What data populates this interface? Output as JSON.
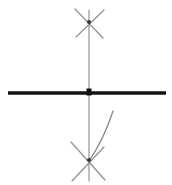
{
  "figure": {
    "width": 172,
    "height": 185,
    "background_color": "#ffffff",
    "ink_color_dark": "#1a1a1a",
    "ink_color_light": "#9a9a9a",
    "ink_color_mid": "#6e6e6e"
  },
  "elements": {
    "horizontal_bar": {
      "name": "horizontal axis bar",
      "x1": 8,
      "y1": 93,
      "x2": 166,
      "y2": 93,
      "thickness": 3.6,
      "color": "#141414"
    },
    "vertical_line": {
      "name": "vertical axis line",
      "x1": 89,
      "y1": 10,
      "x2": 89,
      "y2": 181,
      "thickness": 1.1,
      "color": "#8a8a8a"
    },
    "center_node": {
      "name": "center intersection node",
      "cx": 89,
      "cy": 92,
      "width": 5,
      "height": 7,
      "color": "#111111"
    },
    "top_cross_node": {
      "name": "top crossing node",
      "cx": 89,
      "cy": 22,
      "width": 4,
      "height": 4,
      "color": "#3a3a3a"
    },
    "bottom_cross_node": {
      "name": "bottom crossing node",
      "cx": 89,
      "cy": 160,
      "width": 4,
      "height": 4,
      "color": "#3a3a3a"
    },
    "top_stroke_a": {
      "name": "top X stroke left-down",
      "x1": 75,
      "y1": 9,
      "x2": 103,
      "y2": 38,
      "thickness": 1.2,
      "color": "#8f8f8f"
    },
    "top_stroke_b": {
      "name": "top X stroke right-down",
      "x1": 104,
      "y1": 10,
      "x2": 76,
      "y2": 37,
      "thickness": 1.2,
      "color": "#8f8f8f"
    },
    "bottom_stroke_a": {
      "name": "bottom X stroke left-down",
      "x1": 71,
      "y1": 142,
      "x2": 105,
      "y2": 180,
      "thickness": 1.2,
      "color": "#8f8f8f"
    },
    "bottom_stroke_b": {
      "name": "bottom X stroke right-down",
      "x1": 104,
      "y1": 147,
      "x2": 72,
      "y2": 181,
      "thickness": 1.2,
      "color": "#8f8f8f"
    },
    "curve_stroke": {
      "name": "curved arc stroke right",
      "start_x": 113,
      "start_y": 111,
      "control_x": 104,
      "control_y": 139,
      "end_x": 89,
      "end_y": 161,
      "thickness": 1.3,
      "color": "#8a8a8a"
    }
  }
}
